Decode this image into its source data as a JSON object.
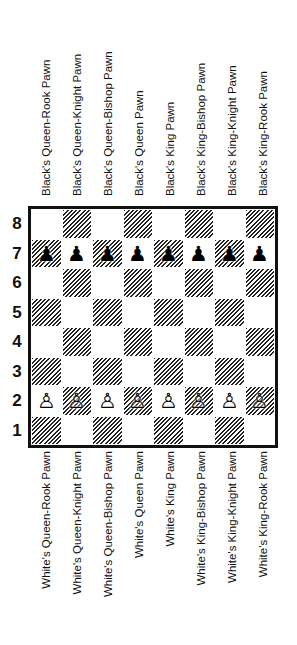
{
  "top_labels": [
    "Black's Queen-Rook Pawn",
    "Black's Queen-Knight Pawn",
    "Black's Queen-Bishop Pawn",
    "Black's Queen Pawn",
    "Black's King Pawn",
    "Black's King-Bishop Pawn",
    "Black's King-Knight Pawn",
    "Black's King-Rook Pawn"
  ],
  "bottom_labels": [
    "White's Queen-Rook Pawn",
    "White's Queen-Knight Pawn",
    "White's Queen-Bishop Pawn",
    "White's Queen Pawn",
    "White's King Pawn",
    "White's King-Bishop Pawn",
    "White's King-Knight Pawn",
    "White's King-Rook Pawn"
  ],
  "ranks": [
    "8",
    "7",
    "6",
    "5",
    "4",
    "3",
    "2",
    "1"
  ],
  "pieces": {
    "black_pawn": "♟",
    "white_pawn": "♙"
  },
  "board": {
    "rank_7": [
      "black_pawn",
      "black_pawn",
      "black_pawn",
      "black_pawn",
      "black_pawn",
      "black_pawn",
      "black_pawn",
      "black_pawn"
    ],
    "rank_2": [
      "white_pawn",
      "white_pawn",
      "white_pawn",
      "white_pawn",
      "white_pawn",
      "white_pawn",
      "white_pawn",
      "white_pawn"
    ]
  }
}
